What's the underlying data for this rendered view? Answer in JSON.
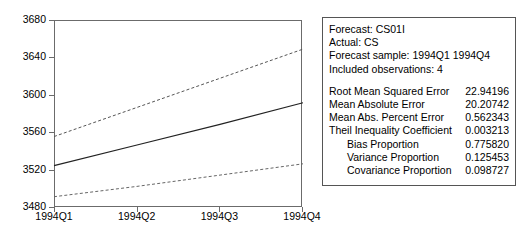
{
  "chart_data": {
    "type": "line",
    "title": "",
    "xlabel": "",
    "ylabel": "",
    "categories": [
      "1994Q1",
      "1994Q2",
      "1994Q3",
      "1994Q4"
    ],
    "ylim": [
      3480,
      3680
    ],
    "yticks": [
      3480,
      3520,
      3560,
      3600,
      3640,
      3680
    ],
    "grid": false,
    "legend": "none",
    "series": [
      {
        "name": "Upper confidence band",
        "style": "dashed",
        "color": "#555555",
        "values": [
          3556,
          3587,
          3618,
          3649
        ]
      },
      {
        "name": "CS01I forecast",
        "style": "solid",
        "color": "#222222",
        "values": [
          3525,
          3547,
          3569,
          3592
        ]
      },
      {
        "name": "Lower confidence band",
        "style": "dashed",
        "color": "#666666",
        "values": [
          3492,
          3503,
          3515,
          3527
        ]
      }
    ]
  },
  "stats_panel": {
    "header_lines": [
      "Forecast: CS01I",
      "Actual: CS",
      "Forecast sample: 1994Q1 1994Q4",
      "Included observations: 4"
    ],
    "metrics": [
      {
        "label": "Root Mean Squared Error",
        "value": "22.94196",
        "indent": false
      },
      {
        "label": "Mean Absolute Error",
        "value": "20.20742",
        "indent": false
      },
      {
        "label": "Mean Abs. Percent Error",
        "value": "0.562343",
        "indent": false
      },
      {
        "label": "Theil Inequality Coefficient",
        "value": "0.003213",
        "indent": false
      },
      {
        "label": "Bias Proportion",
        "value": "0.775820",
        "indent": true
      },
      {
        "label": "Variance Proportion",
        "value": "0.125453",
        "indent": true
      },
      {
        "label": "Covariance Proportion",
        "value": "0.098727",
        "indent": true
      }
    ]
  },
  "colors": {
    "axis": "#6b6b6b",
    "panel_border": "#555555",
    "forecast_line": "#222222",
    "band_line": "#666666",
    "background": "#ffffff"
  }
}
